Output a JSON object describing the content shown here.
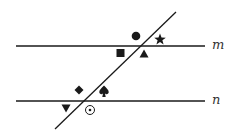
{
  "diagram": {
    "lines": {
      "m": {
        "label": "m",
        "y": 46,
        "x1": 16,
        "x2": 205
      },
      "n": {
        "label": "n",
        "y": 101,
        "x1": 16,
        "x2": 205
      },
      "transversal": {
        "x1": 55,
        "y1": 129,
        "x2": 176,
        "y2": 12
      }
    },
    "symbols": [
      {
        "name": "circle",
        "glyph": "●",
        "x": 136,
        "y": 36,
        "region": "line m, above-left of transversal"
      },
      {
        "name": "star",
        "glyph": "★",
        "x": 160,
        "y": 39,
        "region": "line m, above-right of transversal"
      },
      {
        "name": "square",
        "glyph": "■",
        "x": 121,
        "y": 53,
        "region": "line m, below-left of transversal"
      },
      {
        "name": "triangle-up",
        "glyph": "▲",
        "x": 144,
        "y": 54,
        "region": "line m, below-right of transversal"
      },
      {
        "name": "diamond",
        "glyph": "◆",
        "x": 79,
        "y": 90,
        "region": "line n, above-left of transversal"
      },
      {
        "name": "spade",
        "glyph": "♠",
        "x": 104,
        "y": 91,
        "region": "line n, above-right of transversal"
      },
      {
        "name": "triangle-down",
        "glyph": "▼",
        "x": 66,
        "y": 108,
        "region": "line n, below-left of transversal"
      },
      {
        "name": "circled-dot",
        "glyph": "⊙",
        "x": 90,
        "y": 110,
        "region": "line n, below-right of transversal"
      }
    ],
    "stroke_color": "#1a1a1a"
  }
}
